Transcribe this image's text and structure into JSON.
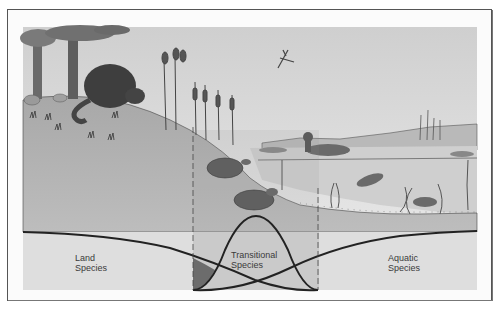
{
  "figure": {
    "zones": [
      {
        "id": "land",
        "label_line1": "Land",
        "label_line2": "Species"
      },
      {
        "id": "transitional",
        "label_line1": "Transitional",
        "label_line2": "Species"
      },
      {
        "id": "aquatic",
        "label_line1": "Aquatic",
        "label_line2": "Species"
      }
    ],
    "illustrations": [
      "trees",
      "beaver",
      "cattails",
      "dragonfly",
      "duck",
      "water-lily",
      "turtle",
      "frog",
      "fish",
      "water-plants",
      "distant-reeds"
    ],
    "colors": {
      "sky": "#d9d9d9",
      "land": "#b4b4b4",
      "water": "#cdcdcd",
      "lower_band": "#dedede",
      "transitional_band": "#bdbdbd",
      "overlap_fill": "#6c6c6c",
      "curve": "#222222"
    }
  }
}
